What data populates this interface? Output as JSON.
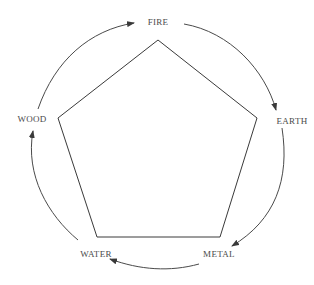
{
  "diagram": {
    "type": "five-elements-cycle",
    "elements": [
      {
        "id": "fire",
        "label": "FIRE"
      },
      {
        "id": "earth",
        "label": "EARTH"
      },
      {
        "id": "metal",
        "label": "METAL"
      },
      {
        "id": "water",
        "label": "WATER"
      },
      {
        "id": "wood",
        "label": "WOOD"
      }
    ],
    "cycle_arrows": [
      {
        "from": "WOOD",
        "to": "FIRE"
      },
      {
        "from": "FIRE",
        "to": "EARTH"
      },
      {
        "from": "EARTH",
        "to": "METAL"
      },
      {
        "from": "METAL",
        "to": "WATER"
      },
      {
        "from": "WATER",
        "to": "WOOD"
      }
    ],
    "inner_shape": "pentagon",
    "colors": {
      "line": "#3a3a3a",
      "text": "#4a4a4a",
      "background": "#ffffff"
    }
  }
}
